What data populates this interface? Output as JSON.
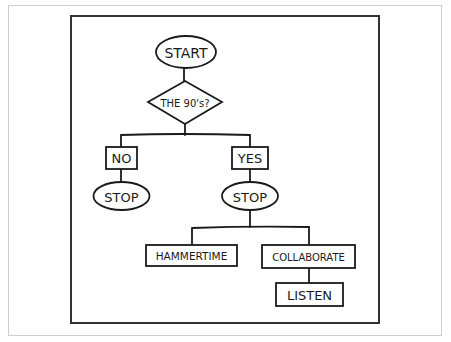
{
  "diagram": {
    "type": "flowchart",
    "style": "hand-drawn comic",
    "colors": {
      "background": "#ffffff",
      "ink": "#1a1a1a",
      "panel_border": "#333333",
      "outer_border": "#cfcfcf"
    },
    "nodes": {
      "start": {
        "label": "START",
        "shape": "ellipse"
      },
      "decision": {
        "label": "THE 90's?",
        "shape": "diamond"
      },
      "no": {
        "label": "NO",
        "shape": "box"
      },
      "stop_no": {
        "label": "STOP",
        "shape": "ellipse"
      },
      "yes": {
        "label": "YES",
        "shape": "box"
      },
      "stop_yes": {
        "label": "STOP",
        "shape": "ellipse"
      },
      "hammertime": {
        "label": "HAMMERTIME",
        "shape": "box"
      },
      "collaborate": {
        "label": "COLLABORATE",
        "shape": "box"
      },
      "listen": {
        "label": "LISTEN",
        "shape": "box"
      }
    },
    "edges": [
      {
        "from": "start",
        "to": "decision"
      },
      {
        "from": "decision",
        "to": "no"
      },
      {
        "from": "decision",
        "to": "yes"
      },
      {
        "from": "no",
        "to": "stop_no"
      },
      {
        "from": "yes",
        "to": "stop_yes"
      },
      {
        "from": "stop_yes",
        "to": "hammertime"
      },
      {
        "from": "stop_yes",
        "to": "collaborate"
      },
      {
        "from": "collaborate",
        "to": "listen"
      }
    ]
  }
}
